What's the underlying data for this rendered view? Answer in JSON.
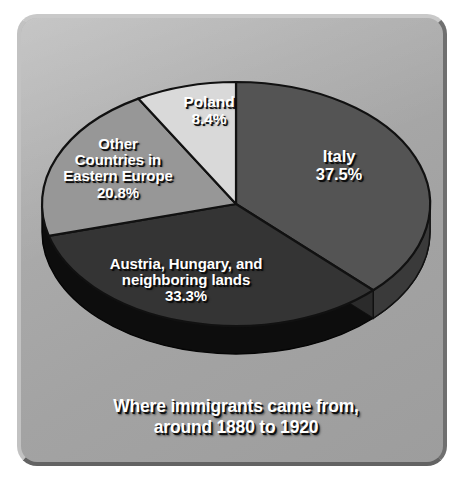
{
  "caption": {
    "line1": "Where immigrants came from,",
    "line2": "around 1880 to 1920"
  },
  "colors": {
    "plate_background": "#a8a8a8",
    "plate_border_light": "#c9c9c9",
    "plate_border_dark": "#636363",
    "label_text": "#ffffff",
    "label_shadow": "#0a0a0a",
    "slice_outline": "#111111",
    "italy_top": "#545454",
    "italy_side": "#3a3a3a",
    "austria_top": "#343434",
    "austria_side": "#0d0d0d",
    "other_top": "#979797",
    "other_side": "#5e5e5e",
    "poland_top": "#d9d9d9",
    "poland_side": "#8c8c8c"
  },
  "chart_data": {
    "type": "pie",
    "title": "Where immigrants came from, around 1880 to 1920",
    "subtitle": "",
    "xlabel": "",
    "ylabel": "",
    "legend": "none",
    "grid": false,
    "three_d": true,
    "start_angle_deg": 0,
    "direction": "clockwise",
    "units": "percent",
    "total": 100.0,
    "labels": [
      "Italy",
      "Austria, Hungary, and neighboring lands",
      "Other Countries in Eastern Europe",
      "Poland"
    ],
    "values": [
      37.5,
      33.3,
      20.8,
      8.4
    ],
    "slices": [
      {
        "key": "italy",
        "name": "Italy",
        "name_lines": [
          "Italy"
        ],
        "value": 37.5,
        "pct_text": "37.5%",
        "color": "#545454",
        "side_color": "#3a3a3a"
      },
      {
        "key": "austria",
        "name": "Austria, Hungary, and neighboring lands",
        "name_lines": [
          "Austria, Hungary, and",
          "neighboring lands"
        ],
        "value": 33.3,
        "pct_text": "33.3%",
        "color": "#343434",
        "side_color": "#0d0d0d"
      },
      {
        "key": "other",
        "name": "Other Countries in Eastern Europe",
        "name_lines": [
          "Other",
          "Countries in",
          "Eastern Europe"
        ],
        "value": 20.8,
        "pct_text": "20.8%",
        "color": "#979797",
        "side_color": "#5e5e5e"
      },
      {
        "key": "poland",
        "name": "Poland",
        "name_lines": [
          "Poland"
        ],
        "value": 8.4,
        "pct_text": "8.4%",
        "color": "#d9d9d9",
        "side_color": "#8c8c8c"
      }
    ]
  },
  "labels": {
    "italy": {
      "l1": "Italy",
      "pct": "37.5%"
    },
    "poland": {
      "l1": "Poland",
      "pct": "8.4%"
    },
    "other": {
      "l1": "Other",
      "l2": "Countries in",
      "l3": "Eastern Europe",
      "pct": "20.8%"
    },
    "austria": {
      "l1": "Austria, Hungary, and",
      "l2": "neighboring lands",
      "pct": "33.3%"
    }
  }
}
